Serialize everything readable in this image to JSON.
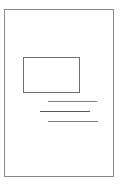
{
  "icon": {
    "type": "document-page-icon",
    "page": {
      "border_color": "#8a8a8a",
      "background": "#ffffff"
    },
    "image_placeholder": {
      "border_color": "#6f6f6f"
    },
    "text_lines": [
      {
        "color": "#7e7e7e"
      },
      {
        "color": "#555555"
      },
      {
        "color": "#7e7e7e"
      }
    ]
  }
}
